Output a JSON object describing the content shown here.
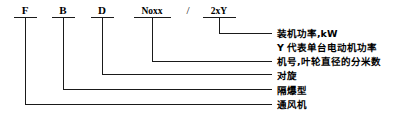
{
  "diagram": {
    "code_tokens": [
      {
        "id": "token-f",
        "text": "F",
        "x": 25,
        "y": 4,
        "style": "normal"
      },
      {
        "id": "token-b",
        "text": "B",
        "x": 63,
        "y": 4,
        "style": "normal"
      },
      {
        "id": "token-d",
        "text": "D",
        "x": 102,
        "y": 4,
        "style": "normal"
      },
      {
        "id": "token-no",
        "text": "Noxx",
        "x": 152,
        "y": 5,
        "style": "small"
      },
      {
        "id": "token-2xy",
        "text": "2xY",
        "x": 219,
        "y": 5,
        "style": "small"
      }
    ],
    "separator": {
      "id": "separator-slash",
      "text": "/",
      "x": 188,
      "y": 4
    },
    "labels": [
      {
        "id": "label-power",
        "text": "装机功率,kW",
        "x": 277,
        "y": 28
      },
      {
        "id": "label-motor-power",
        "text": "Y 代表单台电动机功率",
        "x": 277,
        "y": 42
      },
      {
        "id": "label-model-no",
        "text": "机号,叶轮直径的分米数",
        "x": 277,
        "y": 56
      },
      {
        "id": "label-counter-rot",
        "text": "对旋",
        "x": 277,
        "y": 70
      },
      {
        "id": "label-explosion",
        "text": "隔爆型",
        "x": 277,
        "y": 85
      },
      {
        "id": "label-fan",
        "text": "通风机",
        "x": 277,
        "y": 99
      }
    ],
    "underlines": [
      {
        "id": "underline-f",
        "x1": 14,
        "x2": 37,
        "y": 17
      },
      {
        "id": "underline-b",
        "x1": 52,
        "x2": 75,
        "y": 17
      },
      {
        "id": "underline-d",
        "x1": 91,
        "x2": 114,
        "y": 17
      },
      {
        "id": "underline-no",
        "x1": 134,
        "x2": 171,
        "y": 17
      },
      {
        "id": "underline-2xy",
        "x1": 203,
        "x2": 236,
        "y": 17
      }
    ],
    "leaders": [
      {
        "id": "leader-2xy",
        "x": 219,
        "y_top": 17,
        "y_turn": 33,
        "x_end": 272
      },
      {
        "id": "leader-no",
        "x": 152,
        "y_top": 17,
        "y_turn": 61,
        "x_end": 272
      },
      {
        "id": "leader-d",
        "x": 102,
        "y_top": 17,
        "y_turn": 74,
        "x_end": 272
      },
      {
        "id": "leader-b",
        "x": 63,
        "y_top": 17,
        "y_turn": 89,
        "x_end": 272
      },
      {
        "id": "leader-f",
        "x": 25,
        "y_top": 17,
        "y_turn": 104,
        "x_end": 272
      }
    ],
    "colors": {
      "ink": "#000000",
      "line": "#1a1a1a",
      "background": "#ffffff"
    },
    "line_width": 1
  }
}
